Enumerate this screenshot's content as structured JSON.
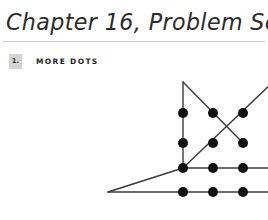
{
  "page": {
    "background_color": "#ffffff",
    "width": 268,
    "height": 220
  },
  "header": {
    "chapter_title": "Chapter 16, Problem Set A",
    "rule_color": "#c9c9c9"
  },
  "problem": {
    "number": "1.",
    "number_box_color": "#d4d4d4",
    "title": "MORE DOTS"
  },
  "figure": {
    "name": "dot-grid-figure",
    "dot_color": "#111111",
    "line_color": "#3a3a3a",
    "dot_radius": 5.0,
    "line_width": 1.4,
    "columns_x": [
      35,
      65,
      95,
      125
    ],
    "rows_y": [
      43,
      73,
      98,
      122
    ],
    "apex_y": 12,
    "left_tail_x": -40,
    "dots": [
      {
        "id": "r1c1",
        "x": 35,
        "y": 43
      },
      {
        "id": "r1c2",
        "x": 65,
        "y": 43
      },
      {
        "id": "r1c3",
        "x": 95,
        "y": 43
      },
      {
        "id": "r1c4",
        "x": 125,
        "y": 43
      },
      {
        "id": "r2c1",
        "x": 35,
        "y": 73
      },
      {
        "id": "r2c2",
        "x": 65,
        "y": 73
      },
      {
        "id": "r2c3",
        "x": 95,
        "y": 73
      },
      {
        "id": "r2c4",
        "x": 125,
        "y": 73
      },
      {
        "id": "r3c1",
        "x": 35,
        "y": 98
      },
      {
        "id": "r3c2",
        "x": 65,
        "y": 98
      },
      {
        "id": "r3c3",
        "x": 95,
        "y": 98
      },
      {
        "id": "r3c4",
        "x": 125,
        "y": 98
      },
      {
        "id": "r4c1",
        "x": 35,
        "y": 122
      },
      {
        "id": "r4c2",
        "x": 65,
        "y": 122
      },
      {
        "id": "r4c3",
        "x": 95,
        "y": 122
      },
      {
        "id": "r4c4",
        "x": 125,
        "y": 122
      }
    ],
    "segments": [
      {
        "id": "left-vertical",
        "x1": 35,
        "y1": 43,
        "x2": 35,
        "y2": 98
      },
      {
        "id": "right-vertical",
        "x1": 125,
        "y1": 43,
        "x2": 125,
        "y2": 98
      },
      {
        "id": "row3-horizontal",
        "x1": 35,
        "y1": 98,
        "x2": 125,
        "y2": 98
      },
      {
        "id": "row4-horizontal",
        "x1": 35,
        "y1": 122,
        "x2": 125,
        "y2": 122
      },
      {
        "id": "left-apex-spur",
        "x1": 35,
        "y1": 12,
        "x2": 35,
        "y2": 43
      },
      {
        "id": "left-apex-diagonal",
        "x1": 35,
        "y1": 12,
        "x2": 95,
        "y2": 73
      },
      {
        "id": "right-apex-spur",
        "x1": 125,
        "y1": 12,
        "x2": 125,
        "y2": 43
      },
      {
        "id": "right-apex-diagonal",
        "x1": 125,
        "y1": 12,
        "x2": 35,
        "y2": 98
      },
      {
        "id": "bottom-left-diagonal",
        "x1": 35,
        "y1": 98,
        "x2": -40,
        "y2": 122
      },
      {
        "id": "bottom-left-tail",
        "x1": -40,
        "y1": 122,
        "x2": 35,
        "y2": 122
      }
    ]
  }
}
